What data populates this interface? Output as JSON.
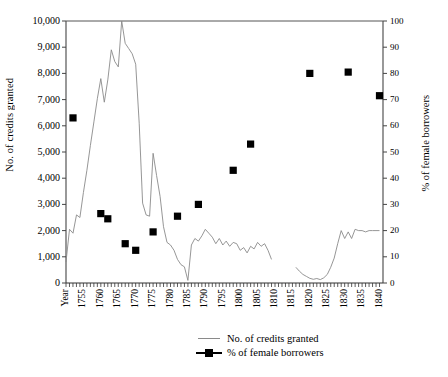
{
  "chart_data": {
    "type": "line",
    "title": "",
    "xlabel": "Year",
    "year_axis_label": "Year",
    "ylabel": "No. of credits granted",
    "ylabel_right": "% of female borrowers",
    "xlim": [
      1750,
      1841
    ],
    "ylim": [
      0,
      10000
    ],
    "ylim_right": [
      0,
      100
    ],
    "grid": false,
    "legend_position": "bottom",
    "y_ticks_left": [
      "0",
      "1,000",
      "2,000",
      "3,000",
      "4,000",
      "5,000",
      "6,000",
      "7,000",
      "8,000",
      "9,000",
      "10,000"
    ],
    "y_ticks_right": [
      "0",
      "10",
      "20",
      "30",
      "40",
      "50",
      "60",
      "70",
      "80",
      "90",
      "100"
    ],
    "x_ticks": [
      "1755",
      "1760",
      "1765",
      "1770",
      "1775",
      "1780",
      "1785",
      "1790",
      "1795",
      "1800",
      "1805",
      "1810",
      "1815",
      "1820",
      "1825",
      "1830",
      "1835",
      "1840"
    ],
    "series": [
      {
        "name": "No. of credits granted",
        "type": "line",
        "axis": "left",
        "color": "#8a8a8a",
        "points": [
          [
            1750,
            800
          ],
          [
            1751,
            2050
          ],
          [
            1752,
            1900
          ],
          [
            1753,
            2600
          ],
          [
            1754,
            2500
          ],
          [
            1755,
            3450
          ],
          [
            1756,
            4300
          ],
          [
            1757,
            5250
          ],
          [
            1758,
            6150
          ],
          [
            1759,
            7050
          ],
          [
            1760,
            7800
          ],
          [
            1761,
            6900
          ],
          [
            1762,
            7750
          ],
          [
            1763,
            8900
          ],
          [
            1764,
            8450
          ],
          [
            1765,
            8250
          ],
          [
            1766,
            10000
          ],
          [
            1767,
            9150
          ],
          [
            1768,
            8950
          ],
          [
            1769,
            8750
          ],
          [
            1770,
            8350
          ],
          [
            1771,
            6100
          ],
          [
            1772,
            3050
          ],
          [
            1773,
            2600
          ],
          [
            1774,
            2550
          ],
          [
            1775,
            4950
          ],
          [
            1776,
            4100
          ],
          [
            1777,
            3300
          ],
          [
            1778,
            2150
          ],
          [
            1779,
            1550
          ],
          [
            1780,
            1450
          ],
          [
            1781,
            1250
          ],
          [
            1782,
            900
          ],
          [
            1783,
            700
          ],
          [
            1784,
            620
          ],
          [
            1785,
            100
          ],
          [
            1786,
            1450
          ],
          [
            1787,
            1700
          ],
          [
            1788,
            1600
          ],
          [
            1789,
            1800
          ],
          [
            1790,
            2050
          ],
          [
            1791,
            1900
          ],
          [
            1792,
            1750
          ],
          [
            1793,
            1500
          ],
          [
            1794,
            1700
          ],
          [
            1795,
            1450
          ],
          [
            1796,
            1600
          ],
          [
            1797,
            1400
          ],
          [
            1798,
            1550
          ],
          [
            1799,
            1500
          ],
          [
            1800,
            1250
          ],
          [
            1801,
            1350
          ],
          [
            1802,
            1150
          ],
          [
            1803,
            1400
          ],
          [
            1404,
            1300
          ],
          [
            1804,
            1300
          ],
          [
            1805,
            1550
          ],
          [
            1806,
            1400
          ],
          [
            1807,
            1500
          ],
          [
            1808,
            1250
          ],
          [
            1809,
            900
          ],
          [
            1816,
            600
          ],
          [
            1817,
            450
          ],
          [
            1818,
            330
          ],
          [
            1819,
            250
          ],
          [
            1820,
            180
          ],
          [
            1821,
            140
          ],
          [
            1822,
            170
          ],
          [
            1823,
            130
          ],
          [
            1824,
            200
          ],
          [
            1825,
            330
          ],
          [
            1826,
            600
          ],
          [
            1827,
            950
          ],
          [
            1828,
            1500
          ],
          [
            1829,
            2000
          ],
          [
            1830,
            1700
          ],
          [
            1831,
            1950
          ],
          [
            1832,
            1700
          ],
          [
            1833,
            2050
          ],
          [
            1834,
            2000
          ],
          [
            1835,
            2000
          ],
          [
            1836,
            1950
          ],
          [
            1837,
            2000
          ],
          [
            1838,
            2000
          ],
          [
            1839,
            2000
          ],
          [
            1840,
            2000
          ]
        ]
      },
      {
        "name": "% of female borrowers",
        "type": "scatter",
        "axis": "right",
        "color": "#000000",
        "marker": "square",
        "points": [
          [
            1752,
            63
          ],
          [
            1760,
            26.5
          ],
          [
            1762,
            24.5
          ],
          [
            1767,
            15
          ],
          [
            1770,
            12.5
          ],
          [
            1775,
            19.5
          ],
          [
            1782,
            25.5
          ],
          [
            1788,
            30
          ],
          [
            1798,
            43
          ],
          [
            1803,
            53
          ],
          [
            1820,
            80
          ],
          [
            1831,
            80.5
          ],
          [
            1840,
            71.5
          ]
        ]
      }
    ],
    "legend": [
      {
        "label": "No. of credits granted",
        "key": "line"
      },
      {
        "label": "% of female borrowers",
        "key": "line-square"
      }
    ]
  }
}
